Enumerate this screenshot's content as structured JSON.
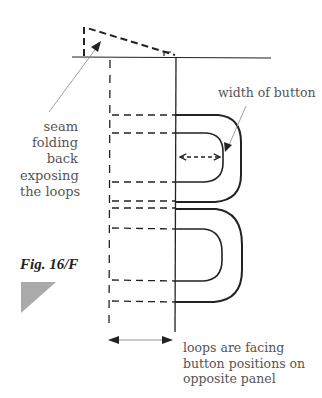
{
  "figure": {
    "label": "Fig. 16/F",
    "marker_color": "#aaaaaa"
  },
  "annotations": {
    "seam": "seam\nfolding\nback\nexposing\nthe loops",
    "width_of_button": "width of button",
    "loops_facing": "loops are facing\nbutton positions on\nopposite panel"
  },
  "colors": {
    "line": "#222222",
    "leader": "#888888",
    "text": "#555555"
  },
  "geometry": {
    "seam_line_y": 57,
    "solid_edge_x": 176,
    "dashed_edge_x": 110,
    "loops": [
      {
        "outer_top": 115,
        "outer_bottom": 202,
        "outer_right": 241,
        "inner_top": 133,
        "inner_bottom": 182,
        "inner_right": 223
      },
      {
        "outer_top": 209,
        "outer_bottom": 302,
        "outer_right": 242,
        "inner_top": 229,
        "inner_bottom": 281,
        "inner_right": 222
      }
    ]
  }
}
